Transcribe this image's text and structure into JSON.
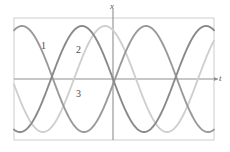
{
  "figure": {
    "name": "three-sinusoidal-waves-plot",
    "background_color": "#ffffff",
    "frame": {
      "color": "#c9c9c9",
      "x0": 14,
      "y0": 18,
      "x1": 214,
      "y1": 140
    },
    "axes": {
      "color": "#8c8c8c",
      "vertical_label": "x",
      "horizontal_label": "t",
      "origin_x": 113,
      "origin_y": 79
    }
  },
  "labels": {
    "curve1": "1",
    "curve2": "2",
    "curve3": "3"
  },
  "chart_data": {
    "type": "line",
    "title": "",
    "xlabel": "t",
    "ylabel": "x",
    "grid": false,
    "legend": "inline-curve-numbers",
    "xlim": [
      -99,
      101
    ],
    "ylim": [
      -61,
      61
    ],
    "annotations": [
      {
        "text": "1",
        "x": 41,
        "y": 41
      },
      {
        "text": "2",
        "x": 76,
        "y": 45
      },
      {
        "text": "3",
        "x": 76,
        "y": 89
      }
    ],
    "series": [
      {
        "name": "1",
        "color": "#9a9a9a",
        "amplitude": 53,
        "period": 124,
        "phase_peak_x": 22,
        "description": "sinusoid peaking near left frame edge"
      },
      {
        "name": "2",
        "color": "#8a8a8a",
        "amplitude": 53,
        "period": 124,
        "phase_peak_x": 82,
        "description": "sinusoid peaking left of the vertical axis"
      },
      {
        "name": "3",
        "color": "#cfcfcf",
        "amplitude": 53,
        "period": 124,
        "phase_peak_x": 105,
        "description": "light sinusoid peaking just left of the vertical axis"
      }
    ]
  }
}
